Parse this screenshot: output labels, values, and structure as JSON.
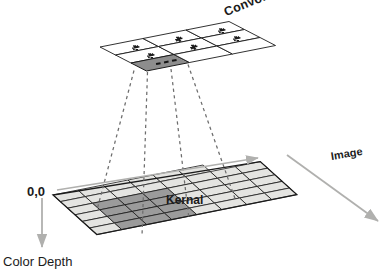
{
  "diagram": {
    "labels": {
      "convolution_matrix": "Convolution Matrix",
      "image": "Image",
      "kernal": "Kernal",
      "origin": "0,0",
      "color_depth": "Color Depth"
    },
    "colors": {
      "stroke": "#1b1b1b",
      "cell_light": "#e4e4e1",
      "cell_dark": "#9b9b9b",
      "matrix_cell_fill": "#ffffff",
      "matrix_cell_shaded": "#8d8d8d",
      "arrow_gray": "#b0b0ae",
      "dashed": "#6d6d6d",
      "text": "#1b1b1b"
    },
    "convolution_matrix": {
      "rows": 3,
      "cols": 3,
      "cell_marks": [
        [
          "asterisk",
          "asterisk",
          "asterisk"
        ],
        [
          "asterisk",
          "asterisk",
          "asterisk"
        ],
        [
          "shaded-dots",
          "empty",
          "empty"
        ]
      ],
      "mark_glyph": "∗",
      "shaded_cell_glyph": "• • •",
      "shaded_cell_index": {
        "row": 2,
        "col": 0
      }
    },
    "image_plane": {
      "rows": 5,
      "cols": 6,
      "kernel_region": {
        "row_start": 2,
        "row_end": 4,
        "col_start": 1,
        "col_end": 3
      },
      "cell_fill_legend": {
        "light": "image pixel",
        "dark": "kernel receptive field"
      }
    },
    "connectors": {
      "count": 4,
      "style": "dashed",
      "from": "convolution-matrix-shaded-cell",
      "to": "kernel-region"
    },
    "arrows": {
      "width_axis": "horizontal right arrow across top of image plane",
      "image_axis": "diagonal arrow labeled Image",
      "depth_axis": "vertical down arrow labeled Color Depth"
    }
  }
}
